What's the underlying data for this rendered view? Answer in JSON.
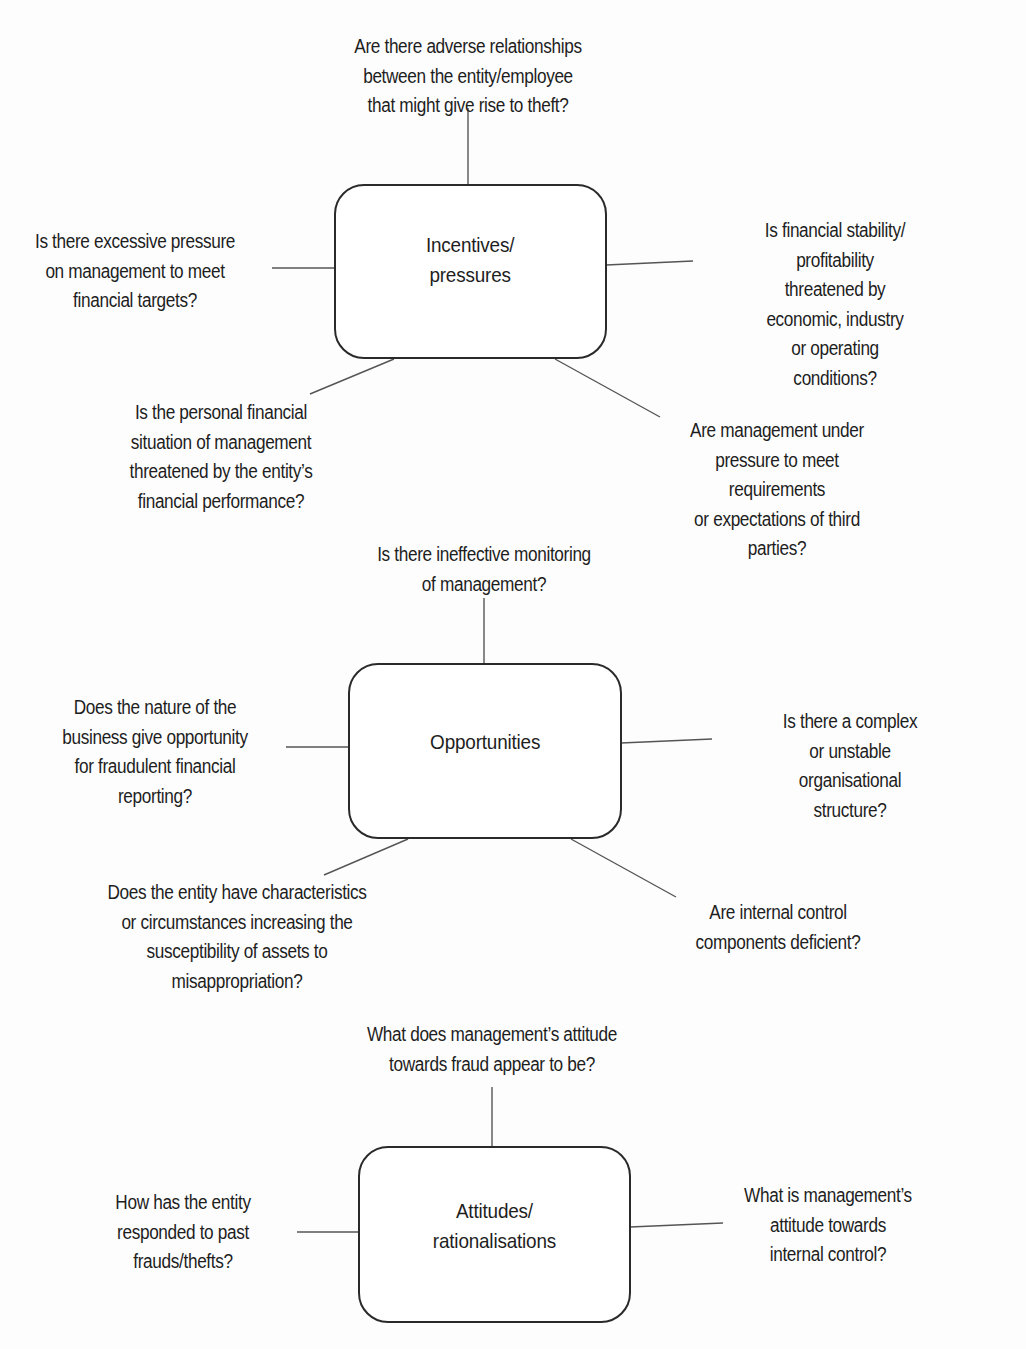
{
  "diagram": {
    "type": "fraud risk factors mind map",
    "groups": [
      {
        "id": "incentives",
        "box_label": "Incentives/\npressures",
        "questions": {
          "top": "Are there adverse relationships\nbetween the entity/employee\nthat might give rise to theft?",
          "left": "Is there excessive pressure\non management to meet\nfinancial targets?",
          "right": "Is financial stability/ profitability\nthreatened by economic, industry\nor operating conditions?",
          "bottom_left": "Is the personal financial\nsituation of management\nthreatened by the entity’s\nfinancial performance?",
          "bottom_right": "Are management under\npressure to meet requirements\nor expectations of third parties?"
        }
      },
      {
        "id": "opportunities",
        "box_label": "Opportunities",
        "questions": {
          "top": "Is there ineffective monitoring\nof management?",
          "left": "Does the nature of the\nbusiness give opportunity\nfor fraudulent financial\nreporting?",
          "right": "Is there a complex or unstable\norganisational structure?",
          "bottom_left": "Does the entity have characteristics\nor circumstances increasing the\nsusceptibility of assets to\nmisappropriation?",
          "bottom_right": "Are internal control\ncomponents deficient?"
        }
      },
      {
        "id": "attitudes",
        "box_label": "Attitudes/\nrationalisations",
        "questions": {
          "top": "What does management’s attitude\ntowards fraud appear to be?",
          "left": "How has the entity\nresponded to past\nfrauds/thefts?",
          "right": "What is management’s\nattitude towards\ninternal control?"
        }
      }
    ],
    "colors": {
      "background": "#fdfdfd",
      "text": "#1e1e1e",
      "box_border": "#2a2a2a",
      "connector": "#555555"
    }
  }
}
